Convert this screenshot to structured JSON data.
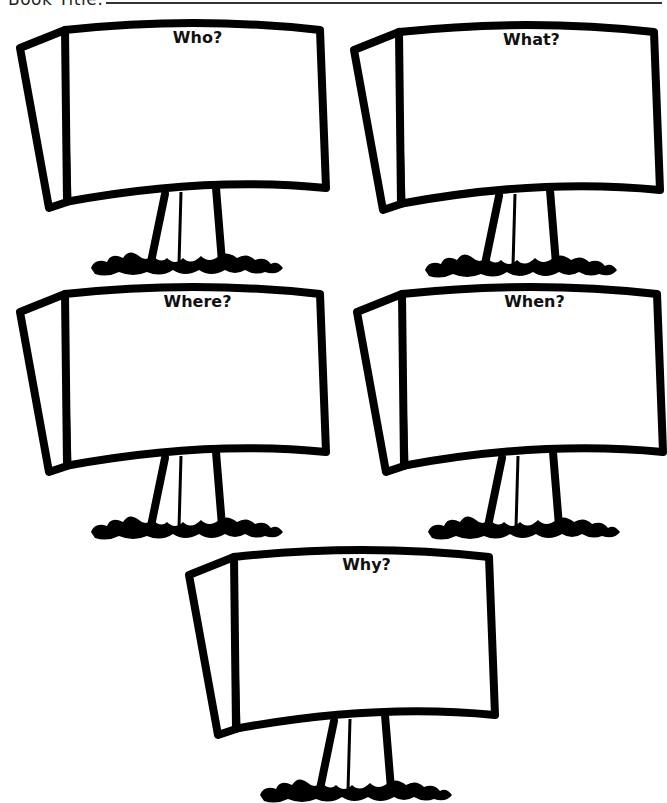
{
  "header": {
    "label": "Book Title:",
    "title_value": ""
  },
  "signs": [
    {
      "id": "who",
      "title": "Who?",
      "x": 15,
      "y": 18,
      "answer": ""
    },
    {
      "id": "what",
      "title": "What?",
      "x": 349,
      "y": 20,
      "answer": ""
    },
    {
      "id": "where",
      "title": "Where?",
      "x": 15,
      "y": 282,
      "answer": ""
    },
    {
      "id": "when",
      "title": "When?",
      "x": 352,
      "y": 282,
      "answer": ""
    },
    {
      "id": "why",
      "title": "Why?",
      "x": 184,
      "y": 545,
      "answer": ""
    }
  ],
  "colors": {
    "ink": "#000000",
    "paper": "#ffffff"
  }
}
